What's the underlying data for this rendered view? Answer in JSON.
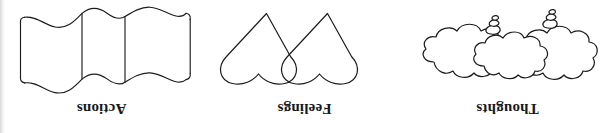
{
  "figure": {
    "orientation": "rotated-180",
    "background_color": "#ffffff",
    "ink_color": "#1a1c1e",
    "panels": [
      {
        "id": "actions",
        "caption": "Actions",
        "symbol": "wavy-flag-banner",
        "symbol_description": "A wavy rectangular banner or flag with two vertical fold lines and undulating top and bottom edges"
      },
      {
        "id": "feelings",
        "caption": "Feelings",
        "symbol": "two-overlapping-hearts",
        "symbol_description": "Two overlapping heart outlines shown inverted, with pointed apexes at the top and rounded lobes at the bottom"
      },
      {
        "id": "thoughts",
        "caption": "Thoughts",
        "symbol": "thought-bubble-clouds",
        "symbol_description": "Three overlapping scalloped thought-bubble clouds with two small trailing bubble stacks"
      }
    ]
  }
}
